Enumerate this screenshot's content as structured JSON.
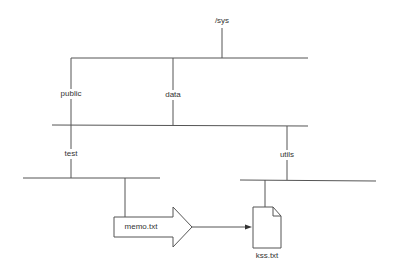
{
  "diagram": {
    "type": "directory-tree",
    "colors": {
      "line": "#555555",
      "text": "#333333",
      "background": "#ffffff"
    },
    "nodes": {
      "root": {
        "label": "/sys"
      },
      "public": {
        "label": "public"
      },
      "data": {
        "label": "data"
      },
      "test": {
        "label": "test"
      },
      "utils": {
        "label": "utils"
      },
      "memo": {
        "label": "memo.txt",
        "shape": "block-arrow"
      },
      "kss": {
        "label": "kss.txt",
        "shape": "document-icon"
      }
    },
    "edges": [
      {
        "from": "/sys",
        "to": "public"
      },
      {
        "from": "/sys",
        "to": "data"
      },
      {
        "from": "public",
        "to": "test"
      },
      {
        "from": "public",
        "to": "utils"
      },
      {
        "from": "test",
        "to": "memo.txt"
      },
      {
        "from": "utils",
        "to": "kss.txt"
      },
      {
        "from": "memo.txt",
        "to": "kss.txt",
        "style": "arrow"
      }
    ]
  }
}
